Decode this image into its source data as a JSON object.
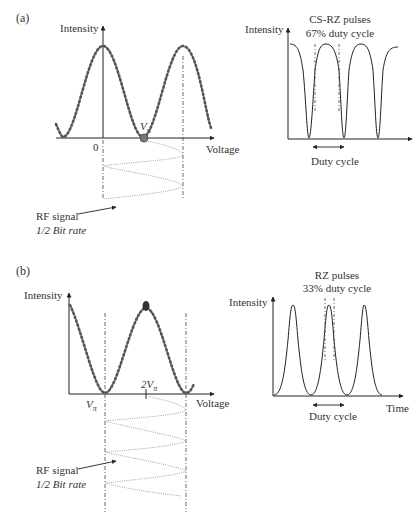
{
  "figure": {
    "panel_a": {
      "label": "(a)",
      "transfer": {
        "y_axis_label": "Intensity",
        "x_axis_label": "Voltage",
        "origin_label": "0",
        "bias_label": "V",
        "bias_subscript": "π",
        "bias_point": "null (V_pi)"
      },
      "rf_signal": {
        "line1": "RF signal",
        "line2": "1/2 Bit rate"
      },
      "output": {
        "title_line1": "CS-RZ pulses",
        "title_line2": "67% duty cycle",
        "y_axis_label": "Intensity",
        "duty_cycle_label": "Duty cycle"
      }
    },
    "panel_b": {
      "label": "(b)",
      "transfer": {
        "y_axis_label": "Intensity",
        "x_axis_label": "Voltage",
        "bias_label_vpi": "V",
        "bias_label_vpi_sub": "π",
        "bias_label_2vpi": "2V",
        "bias_label_2vpi_sub": "π",
        "bias_point": "peak (2V_pi)"
      },
      "rf_signal": {
        "line1": "RF signal",
        "line2": "1/2 Bit rate"
      },
      "output": {
        "title_line1": "RZ pulses",
        "title_line2": "33% duty cycle",
        "y_axis_label": "Intensity",
        "x_axis_label": "Time",
        "duty_cycle_label": "Duty cycle"
      }
    },
    "colors": {
      "curve_dots": "#555555",
      "axis": "#222222",
      "rf_signal": "#9a9a9a",
      "bias_point": "#666666",
      "bias_point_b": "#333333"
    }
  }
}
